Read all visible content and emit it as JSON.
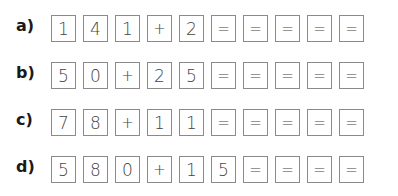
{
  "exercises": [
    {
      "label": "a)",
      "cells": [
        "1",
        "4",
        "1",
        "+",
        "2",
        "=",
        "=",
        "=",
        "=",
        "="
      ]
    },
    {
      "label": "b)",
      "cells": [
        "5",
        "0",
        "+",
        "2",
        "5",
        "=",
        "=",
        "=",
        "=",
        "="
      ]
    },
    {
      "label": "c)",
      "cells": [
        "7",
        "8",
        "+",
        "1",
        "1",
        "=",
        "=",
        "=",
        "=",
        "="
      ]
    },
    {
      "label": "d)",
      "cells": [
        "5",
        "8",
        "0",
        "+",
        "1",
        "5",
        "=",
        "=",
        "=",
        "="
      ]
    }
  ]
}
